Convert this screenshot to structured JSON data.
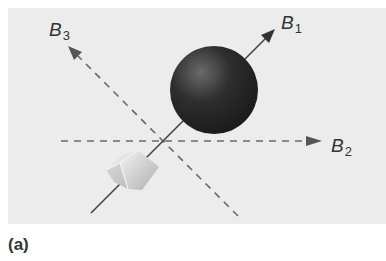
{
  "figure": {
    "caption": "(a)",
    "axes": [
      {
        "id": "B1",
        "symbol": "B",
        "subscript": "1",
        "style": "solid"
      },
      {
        "id": "B2",
        "symbol": "B",
        "subscript": "2",
        "style": "dashed"
      },
      {
        "id": "B3",
        "symbol": "B",
        "subscript": "3",
        "style": "dashed"
      }
    ],
    "objects": [
      "dark sphere",
      "light cube"
    ],
    "colors": {
      "panel": "#ececec",
      "line": "#555555",
      "sphere": "#2a2a2a",
      "cube": "#c8c8c8"
    }
  }
}
